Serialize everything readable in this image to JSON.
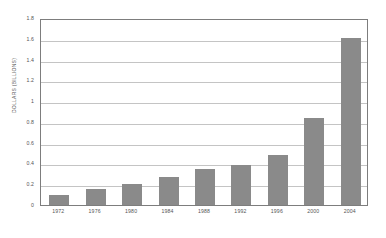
{
  "chart_data": {
    "type": "bar",
    "title": "",
    "subtitle": "",
    "xlabel": "",
    "ylabel": "DOLLARS (BILLIONS)",
    "categories": [
      "1972",
      "1976",
      "1980",
      "1984",
      "1988",
      "1992",
      "1996",
      "2000",
      "2004"
    ],
    "values": [
      0.1,
      0.155,
      0.2,
      0.265,
      0.345,
      0.385,
      0.48,
      0.835,
      1.61
    ],
    "ylim": [
      0,
      1.8
    ],
    "ytick_labels": [
      "1.8",
      "1.6",
      "1.4",
      "1.2",
      "1",
      "0.8",
      "0.6",
      "0.4",
      "0.2",
      "0"
    ],
    "ytick_values": [
      1.8,
      1.6,
      1.4,
      1.2,
      1.0,
      0.8,
      0.6,
      0.4,
      0.2,
      0
    ],
    "grid": "horizontal",
    "legend": "none",
    "annotations": [],
    "colors": {
      "bar": "#8a8a8a",
      "gridline": "#c4c4c4",
      "frame": "#7d7d7d",
      "background": "#ffffff",
      "text": "#555555"
    }
  }
}
